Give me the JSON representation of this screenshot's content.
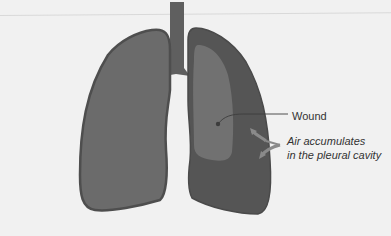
{
  "diagram": {
    "labels": {
      "wound": "Wound",
      "air_line1": "Air accumulates",
      "air_line2": "in the pleural cavity"
    },
    "colors": {
      "background": "#f1f1f1",
      "left_lung": "#6b6b6b",
      "left_lung_outline": "#4e4e4e",
      "right_pleural_cavity": "#555555",
      "right_collapsed_lung": "#707070",
      "trachea": "#5f5f5f",
      "arrow": "#8a8a8a",
      "text": "#333333"
    },
    "parts": [
      "trachea",
      "left-lung",
      "right-lung-pleural-cavity",
      "collapsed-lung",
      "wound",
      "air-arrows"
    ]
  }
}
